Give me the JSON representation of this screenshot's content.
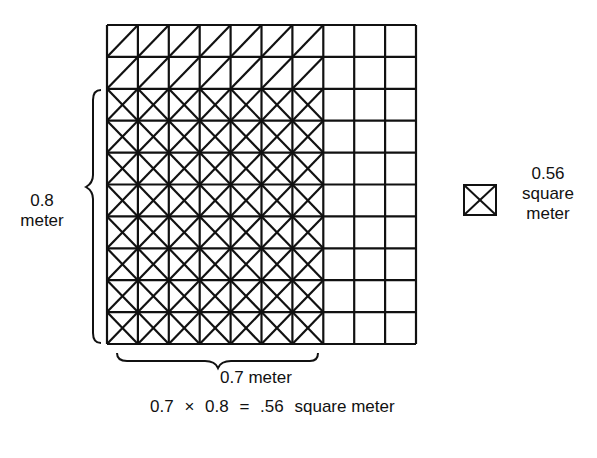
{
  "diagram": {
    "grid": {
      "columns": 10,
      "rows": 10,
      "shaded_columns": 7,
      "shaded_rows": 8,
      "single_diagonal_rows": 2
    },
    "labels": {
      "height_value": "0.8",
      "height_unit": "meter",
      "width_label": "0.7 meter",
      "legend_value": "0.56",
      "legend_unit_1": "square",
      "legend_unit_2": "meter"
    },
    "equation": {
      "a": "0.7",
      "op": "×",
      "b": "0.8",
      "eq": "=",
      "result": ".56",
      "unit": "square meter"
    },
    "colors": {
      "line": "#111111",
      "background": "#ffffff"
    }
  }
}
